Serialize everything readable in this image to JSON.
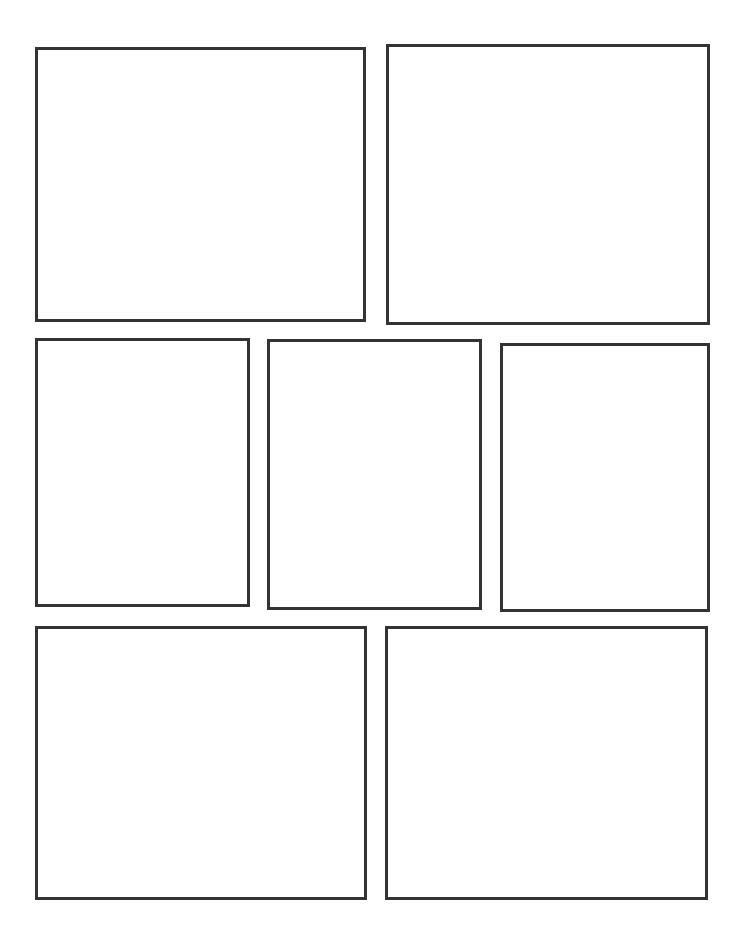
{
  "page": {
    "background_color": "#ffffff",
    "width": 744,
    "height": 938,
    "panel_border_color": "#333333",
    "panel_fill_color": "#ffffff",
    "panel_border_width": 3,
    "panel_count": 7,
    "row_count": 3
  },
  "rows": [
    {
      "index": 1,
      "panel_count": 2,
      "panel_ids": [
        "panel-1",
        "panel-2"
      ]
    },
    {
      "index": 2,
      "panel_count": 3,
      "panel_ids": [
        "panel-3",
        "panel-4",
        "panel-5"
      ]
    },
    {
      "index": 3,
      "panel_count": 2,
      "panel_ids": [
        "panel-6",
        "panel-7"
      ]
    }
  ],
  "panels": [
    {
      "id": "panel-1",
      "row": 1,
      "column": 1,
      "number": "1",
      "content": "",
      "x": 35,
      "y": 47,
      "width": 331,
      "height": 275
    },
    {
      "id": "panel-2",
      "row": 1,
      "column": 2,
      "number": "2",
      "content": "",
      "x": 386,
      "y": 44,
      "width": 324,
      "height": 281
    },
    {
      "id": "panel-3",
      "row": 2,
      "column": 1,
      "number": "3",
      "content": "",
      "x": 35,
      "y": 338,
      "width": 215,
      "height": 269
    },
    {
      "id": "panel-4",
      "row": 2,
      "column": 2,
      "number": "4",
      "content": "",
      "x": 267,
      "y": 339,
      "width": 215,
      "height": 271
    },
    {
      "id": "panel-5",
      "row": 2,
      "column": 3,
      "number": "5",
      "content": "",
      "x": 500,
      "y": 343,
      "width": 210,
      "height": 269
    },
    {
      "id": "panel-6",
      "row": 3,
      "column": 1,
      "number": "6",
      "content": "",
      "x": 35,
      "y": 626,
      "width": 332,
      "height": 274
    },
    {
      "id": "panel-7",
      "row": 3,
      "column": 2,
      "number": "7",
      "content": "",
      "x": 385,
      "y": 626,
      "width": 323,
      "height": 274
    }
  ]
}
